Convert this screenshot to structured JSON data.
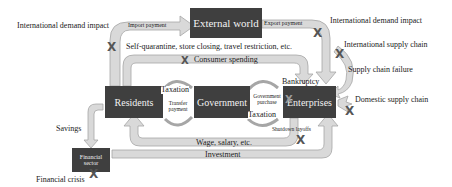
{
  "nodes": {
    "external_world": "External world",
    "residents": "Residents",
    "government": "Government",
    "enterprises": "Enterprises",
    "financial_sector": "Financial sector"
  },
  "flows": {
    "import_payment": "Import payment",
    "export_payment": "Export payment",
    "consumer_spending": "Consumer spending",
    "taxation_residents": "Taxation",
    "transfer_payment": "Transfer payment",
    "government_purchase": "Government purchase",
    "taxation_enterprises": "Taxation",
    "wage_salary": "Wage, salary, etc.",
    "savings": "Savings",
    "investment": "Investment"
  },
  "impacts": {
    "intl_demand_left": "International demand impact",
    "intl_demand_right": "International demand impact",
    "self_quarantine": "Self-quarantine, store closing, travel restriction, etc.",
    "intl_supply_chain": "International supply chain",
    "supply_chain_failure": "Supply chain failure",
    "domestic_supply_chain": "Domestic supply chain",
    "bankruptcy": "Bankruptcy",
    "shutdown_layoffs": "Shutdown layoffs",
    "financial_crisis": "Financial crisis"
  },
  "colors": {
    "box": "#3f3f3f",
    "arrow_fill": "#d9d9d9",
    "arrow_stroke": "#a6a6a6",
    "x_mark": "#555555"
  },
  "x_symbol": "X"
}
